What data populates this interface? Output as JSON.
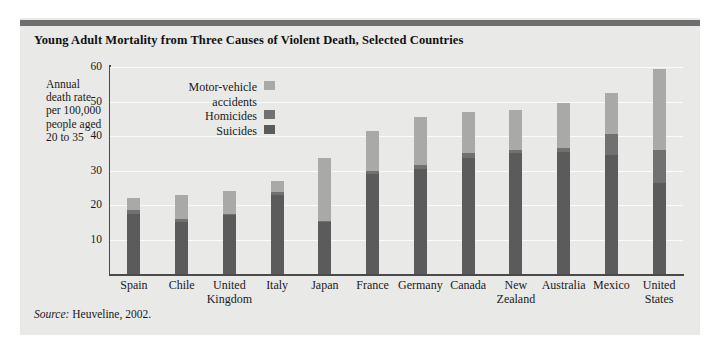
{
  "figure": {
    "title": "Young Adult Mortality from Three Causes of Violent Death, Selected Countries",
    "source_label": "Source:",
    "source_text": "Heuveline, 2002.",
    "axis_title_lines": [
      "Annual",
      "death rate",
      "per 100,000",
      "people aged",
      "20 to 35"
    ]
  },
  "legend": {
    "items": [
      {
        "label_line1": "Motor-vehicle",
        "label_line2": "accidents",
        "color": "#a9a9a7"
      },
      {
        "label_line1": "Homicides",
        "label_line2": "",
        "color": "#717171"
      },
      {
        "label_line1": "Suicides",
        "label_line2": "",
        "color": "#5b5b5b"
      }
    ]
  },
  "chart_data": {
    "type": "bar",
    "stacked": true,
    "title": "Young Adult Mortality from Three Causes of Violent Death, Selected Countries",
    "xlabel": "",
    "ylabel": "Annual death rate per 100,000 people aged 20 to 35",
    "ylim": [
      0,
      60
    ],
    "yticks": [
      10,
      20,
      30,
      40,
      50,
      60
    ],
    "grid": true,
    "legend_position": "upper-left-inside",
    "categories": [
      "Spain",
      "Chile",
      "United Kingdom",
      "Italy",
      "Japan",
      "France",
      "Germany",
      "Canada",
      "New Zealand",
      "Australia",
      "Mexico",
      "United States"
    ],
    "category_lines": [
      [
        "Spain"
      ],
      [
        "Chile"
      ],
      [
        "United",
        "Kingdom"
      ],
      [
        "Italy"
      ],
      [
        "Japan"
      ],
      [
        "France"
      ],
      [
        "Germany"
      ],
      [
        "Canada"
      ],
      [
        "New",
        "Zealand"
      ],
      [
        "Australia"
      ],
      [
        "Mexico"
      ],
      [
        "United",
        "States"
      ]
    ],
    "series": [
      {
        "name": "Suicides",
        "color": "#5b5b5b",
        "values": [
          17.5,
          15.0,
          17.0,
          23.0,
          15.0,
          29.0,
          30.5,
          33.5,
          35.0,
          35.5,
          34.5,
          26.5
        ]
      },
      {
        "name": "Homicides",
        "color": "#717171",
        "values": [
          1.0,
          1.0,
          0.5,
          0.8,
          0.3,
          1.0,
          1.0,
          1.5,
          1.0,
          1.0,
          6.0,
          9.5
        ]
      },
      {
        "name": "Motor-vehicle accidents",
        "color": "#a9a9a7",
        "values": [
          3.5,
          7.0,
          6.5,
          3.2,
          18.2,
          11.5,
          14.0,
          12.0,
          11.5,
          13.0,
          12.0,
          23.5
        ]
      }
    ],
    "totals": [
      22.0,
      23.0,
      24.0,
      27.0,
      33.5,
      41.5,
      45.5,
      47.0,
      47.5,
      49.5,
      52.5,
      59.5
    ]
  },
  "colors": {
    "panel_background": "#e9e9e7",
    "top_rule": "#6e6e6e",
    "axis": "#4a4a4a",
    "gridline": "#fbfbfa",
    "text": "#1a1a1a"
  }
}
